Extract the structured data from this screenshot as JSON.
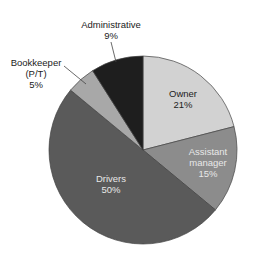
{
  "chart_data": {
    "type": "pie",
    "title": "",
    "center": [
      143,
      150
    ],
    "radius": 94,
    "start_angle_deg": 0,
    "direction": "clockwise",
    "slices": [
      {
        "label": "Owner",
        "value": 21,
        "display": "21%",
        "color": "#d2d2d2"
      },
      {
        "label": "Assistant manager",
        "value": 15,
        "display": "15%",
        "color": "#8c8c8c"
      },
      {
        "label": "Drivers",
        "value": 50,
        "display": "50%",
        "color": "#5a5a5a"
      },
      {
        "label": "Bookkeeper (P/T)",
        "value": 5,
        "display": "5%",
        "color": "#a8a8a8"
      },
      {
        "label": "Administrative",
        "value": 9,
        "display": "9%",
        "color": "#1e1e1e"
      }
    ],
    "stroke_color": "#444444"
  },
  "labels": {
    "owner": {
      "line1": "Owner",
      "line2": "21%"
    },
    "assistant": {
      "line1": "Assistant",
      "line2": "manager",
      "line3": "15%"
    },
    "drivers": {
      "line1": "Drivers",
      "line2": "50%"
    },
    "bookkeeper": {
      "line1": "Bookkeeper",
      "line2": "(P/T)",
      "line3": "5%"
    },
    "administrative": {
      "line1": "Administrative",
      "line2": "9%"
    }
  }
}
